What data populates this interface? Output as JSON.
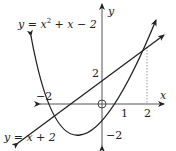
{
  "diagram": {
    "title": "",
    "axes": {
      "x_label": "x",
      "y_label": "y",
      "origin_label": "O"
    },
    "curves": [
      {
        "name": "parabola",
        "equation": "y = x² + x − 2",
        "label_pre": "y = x",
        "label_sup": "2",
        "label_post": " + x − 2"
      },
      {
        "name": "line",
        "equation": "y = x + 2",
        "label": "y = x + 2"
      }
    ],
    "tick_labels": {
      "x_neg2": "−2",
      "x_1": "1",
      "x_2": "2",
      "y_2": "2",
      "y_neg2": "−2"
    },
    "intersections": [
      [
        -2,
        0
      ],
      [
        2,
        4
      ]
    ],
    "line_color": "#222222",
    "dotted_color": "#999999"
  }
}
